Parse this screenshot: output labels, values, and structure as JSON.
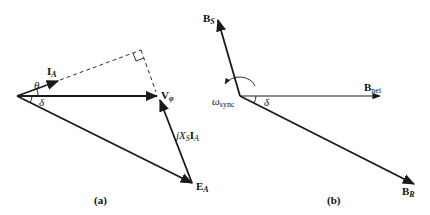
{
  "panel_a": {
    "caption": "(a)",
    "labels": {
      "ia_main": "I",
      "ia_sub": "A",
      "theta": "θ",
      "delta": "δ",
      "vphi_main": "V",
      "vphi_sub": "φ",
      "jxs_j": "jX",
      "jxs_sub": "S",
      "jxs_i": "I",
      "jxs_isub": "A",
      "ea_main": "E",
      "ea_sub": "A"
    }
  },
  "panel_b": {
    "caption": "(b)",
    "labels": {
      "bs_main": "B",
      "bs_sub": "S",
      "omega_main": "ω",
      "omega_sub": "sync",
      "delta": "δ",
      "bnet_main": "B",
      "bnet_sub": "net",
      "br_main": "B",
      "br_sub": "R"
    }
  },
  "colors": {
    "stroke": "#1a1a1a",
    "background": "#ffffff"
  }
}
